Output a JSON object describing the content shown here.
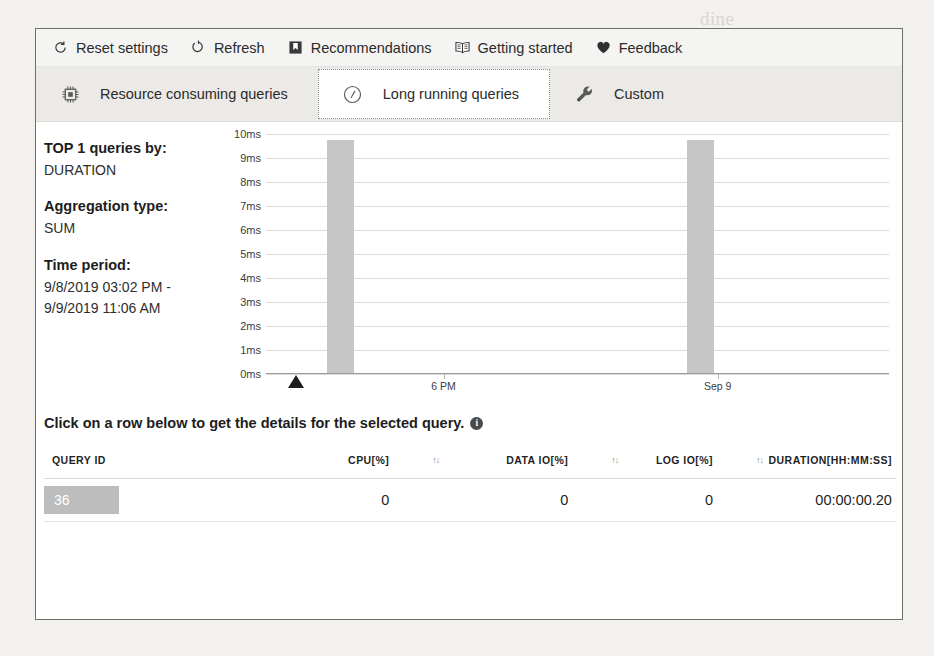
{
  "commandbar": {
    "items": [
      {
        "label": "Reset settings",
        "icon": "reset-icon"
      },
      {
        "label": "Refresh",
        "icon": "refresh-icon"
      },
      {
        "label": "Recommendations",
        "icon": "bookmark-icon"
      },
      {
        "label": "Getting started",
        "icon": "book-icon"
      },
      {
        "label": "Feedback",
        "icon": "heart-icon"
      }
    ]
  },
  "tabs": [
    {
      "label": "Resource consuming queries",
      "icon": "cpu-chip-icon",
      "selected": false
    },
    {
      "label": "Long running queries",
      "icon": "clock-icon",
      "selected": true
    },
    {
      "label": "Custom",
      "icon": "wrench-icon",
      "selected": false
    }
  ],
  "infopanel": {
    "top_label": "TOP 1 queries by:",
    "top_value": "DURATION",
    "aggregation_label": "Aggregation type:",
    "aggregation_value": "SUM",
    "time_label": "Time period:",
    "time_value_line1": "9/8/2019 03:02 PM -",
    "time_value_line2": "9/9/2019 11:06 AM"
  },
  "hint": {
    "text": "Click on a row below to get the details for the selected query.",
    "info_glyph": "i"
  },
  "table": {
    "columns": [
      {
        "key": "query_id",
        "label": "QUERY ID",
        "sortable": false
      },
      {
        "key": "cpu",
        "label": "CPU[%]",
        "sortable": true
      },
      {
        "key": "data_io",
        "label": "DATA IO[%]",
        "sortable": true
      },
      {
        "key": "log_io",
        "label": "LOG IO[%]",
        "sortable": true
      },
      {
        "key": "duration",
        "label": "DURATION[HH:MM:SS]",
        "sortable": false
      }
    ],
    "sort_glyph": "↑↓",
    "rows": [
      {
        "query_id": "36",
        "cpu": "0",
        "data_io": "0",
        "log_io": "0",
        "duration": "00:00:00.20",
        "selected": true
      }
    ]
  },
  "chart_data": {
    "type": "bar",
    "title": "",
    "xlabel": "",
    "ylabel": "",
    "ylim": [
      0,
      10
    ],
    "y_unit": "ms",
    "y_ticks": [
      "0ms",
      "1ms",
      "2ms",
      "3ms",
      "4ms",
      "5ms",
      "6ms",
      "7ms",
      "8ms",
      "9ms",
      "10ms"
    ],
    "y_tick_values": [
      0,
      1,
      2,
      3,
      4,
      5,
      6,
      7,
      8,
      9,
      10
    ],
    "x_ticks": [
      {
        "label": "6 PM",
        "position_pct": 28.5
      },
      {
        "label": "Sep 9",
        "position_pct": 72.5
      }
    ],
    "grid": true,
    "legend": "none",
    "bar_color": "#c6c6c6",
    "series": [
      {
        "name": "DURATION",
        "bars": [
          {
            "x_label": "",
            "value": 9.7,
            "position_pct": 9.8,
            "width_pct": 4.4
          },
          {
            "x_label": "",
            "value": 9.7,
            "position_pct": 67.5,
            "width_pct": 4.4
          }
        ]
      }
    ],
    "marker": {
      "type": "triangle",
      "position_pct": 4.8,
      "color": "#1c1c1c"
    }
  },
  "ghost_text": [
    {
      "text": "dine",
      "x": 700,
      "y": 8
    },
    {
      "text": "RESULTS",
      "x": 690,
      "y": 58
    },
    {
      "text": "A do 1 GB1 installed",
      "x": 640,
      "y": 190
    },
    {
      "text": "Monitor and",
      "x": 610,
      "y": 258
    },
    {
      "text": "the job . for the",
      "x": 600,
      "y": 292
    },
    {
      "text": "chock - it a state in",
      "x": 560,
      "y": 330
    },
    {
      "text": "Monitoring and Tuning",
      "x": 120,
      "y": 482
    },
    {
      "text": "for this last",
      "x": 560,
      "y": 506
    },
    {
      "text": "the long - term",
      "x": 120,
      "y": 562
    },
    {
      "text": "them and",
      "x": 180,
      "y": 600
    }
  ]
}
